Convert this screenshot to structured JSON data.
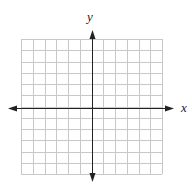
{
  "diagram": {
    "type": "coordinate-plane",
    "axis_labels": {
      "x": "x",
      "y": "y"
    },
    "grid": {
      "columns": 12,
      "rows": 12,
      "left": 21,
      "top": 39,
      "right": 162,
      "bottom": 174,
      "line_color": "#c8c8c8"
    },
    "axes": {
      "origin_x": 92,
      "origin_y": 108,
      "x_axis_start": 8,
      "x_axis_end": 174,
      "y_axis_start": 30,
      "y_axis_end": 182,
      "color": "#222222"
    }
  }
}
